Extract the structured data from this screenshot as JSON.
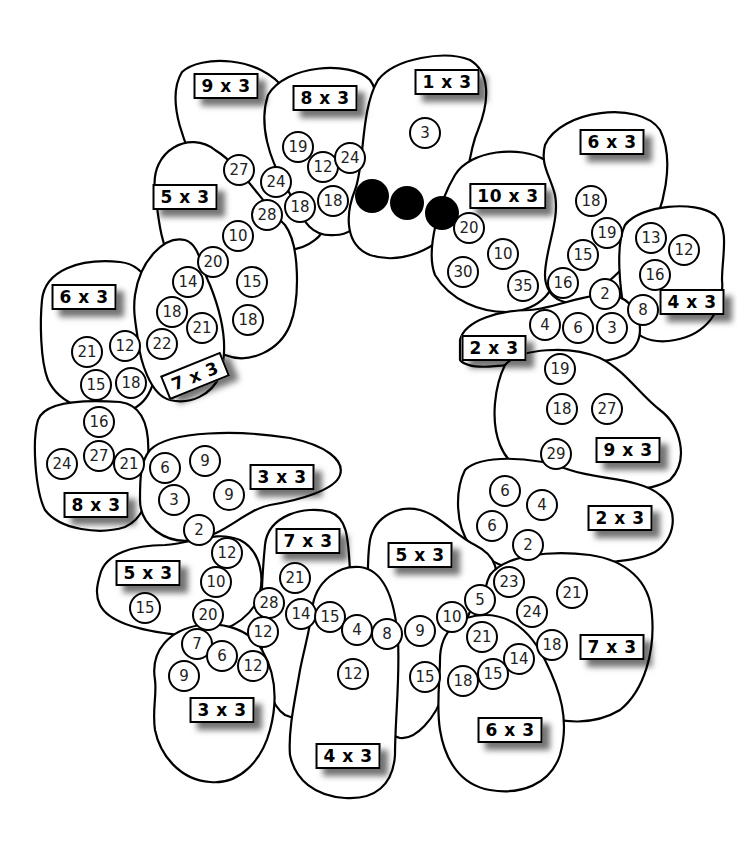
{
  "worksheet": {
    "theme": "3 times table caterpillar / flower ring puzzle",
    "colors": {
      "outline": "#000000",
      "fill": "#ffffff",
      "dot": "#000000"
    }
  },
  "regions": [
    {
      "id": "r1",
      "label": "1 x 3",
      "lx": 447,
      "ly": 82,
      "numbers": [
        {
          "v": "3",
          "x": 425,
          "y": 133
        }
      ]
    },
    {
      "id": "r2",
      "label": "8 x 3",
      "lx": 325,
      "ly": 98,
      "numbers": [
        {
          "v": "19",
          "x": 298,
          "y": 147
        },
        {
          "v": "12",
          "x": 323,
          "y": 167
        },
        {
          "v": "24",
          "x": 350,
          "y": 158
        },
        {
          "v": "18",
          "x": 333,
          "y": 201
        },
        {
          "v": "18",
          "x": 300,
          "y": 207
        }
      ]
    },
    {
      "id": "r3",
      "label": "9 x 3",
      "lx": 226,
      "ly": 86,
      "numbers": [
        {
          "v": "27",
          "x": 239,
          "y": 170
        },
        {
          "v": "24",
          "x": 276,
          "y": 182
        },
        {
          "v": "28",
          "x": 267,
          "y": 215
        }
      ]
    },
    {
      "id": "r4",
      "label": "5 x 3",
      "lx": 185,
      "ly": 197,
      "numbers": [
        {
          "v": "10",
          "x": 238,
          "y": 236
        },
        {
          "v": "20",
          "x": 213,
          "y": 262
        },
        {
          "v": "15",
          "x": 252,
          "y": 282
        },
        {
          "v": "18",
          "x": 248,
          "y": 320
        }
      ]
    },
    {
      "id": "r5",
      "label": "10 x 3",
      "lx": 508,
      "ly": 196,
      "numbers": [
        {
          "v": "20",
          "x": 469,
          "y": 228
        },
        {
          "v": "10",
          "x": 503,
          "y": 254
        },
        {
          "v": "30",
          "x": 463,
          "y": 272
        },
        {
          "v": "35",
          "x": 523,
          "y": 286
        }
      ]
    },
    {
      "id": "r6",
      "label": "6 x 3",
      "lx": 612,
      "ly": 142,
      "numbers": [
        {
          "v": "18",
          "x": 591,
          "y": 201
        },
        {
          "v": "19",
          "x": 607,
          "y": 233
        },
        {
          "v": "15",
          "x": 583,
          "y": 255
        },
        {
          "v": "16",
          "x": 563,
          "y": 283
        }
      ]
    },
    {
      "id": "r7",
      "label": "4 x 3",
      "lx": 692,
      "ly": 302,
      "numbers": [
        {
          "v": "13",
          "x": 651,
          "y": 238
        },
        {
          "v": "12",
          "x": 684,
          "y": 250
        },
        {
          "v": "16",
          "x": 655,
          "y": 275
        },
        {
          "v": "8",
          "x": 643,
          "y": 310
        }
      ]
    },
    {
      "id": "r8",
      "label": "2 x 3",
      "lx": 494,
      "ly": 348,
      "numbers": [
        {
          "v": "2",
          "x": 605,
          "y": 294
        },
        {
          "v": "4",
          "x": 545,
          "y": 325
        },
        {
          "v": "6",
          "x": 578,
          "y": 328
        },
        {
          "v": "3",
          "x": 612,
          "y": 328
        }
      ]
    },
    {
      "id": "r9",
      "label": "6 x 3",
      "lx": 84,
      "ly": 297,
      "numbers": [
        {
          "v": "21",
          "x": 87,
          "y": 352
        },
        {
          "v": "12",
          "x": 125,
          "y": 346
        },
        {
          "v": "15",
          "x": 96,
          "y": 385
        },
        {
          "v": "18",
          "x": 131,
          "y": 383
        }
      ]
    },
    {
      "id": "r10",
      "label": "7 x 3",
      "lx": 195,
      "ly": 376,
      "rotate": -22,
      "numbers": [
        {
          "v": "14",
          "x": 188,
          "y": 282
        },
        {
          "v": "18",
          "x": 172,
          "y": 312
        },
        {
          "v": "21",
          "x": 202,
          "y": 328
        },
        {
          "v": "22",
          "x": 162,
          "y": 344
        }
      ]
    },
    {
      "id": "r11",
      "label": "9 x 3",
      "lx": 628,
      "ly": 450,
      "numbers": [
        {
          "v": "19",
          "x": 560,
          "y": 369
        },
        {
          "v": "18",
          "x": 562,
          "y": 409
        },
        {
          "v": "27",
          "x": 607,
          "y": 409
        },
        {
          "v": "29",
          "x": 556,
          "y": 454
        }
      ]
    },
    {
      "id": "r12",
      "label": "8 x 3",
      "lx": 96,
      "ly": 505,
      "numbers": [
        {
          "v": "16",
          "x": 99,
          "y": 422
        },
        {
          "v": "27",
          "x": 99,
          "y": 456
        },
        {
          "v": "21",
          "x": 129,
          "y": 464
        },
        {
          "v": "24",
          "x": 62,
          "y": 464
        }
      ]
    },
    {
      "id": "r13",
      "label": "3 x 3",
      "lx": 282,
      "ly": 477,
      "numbers": [
        {
          "v": "6",
          "x": 165,
          "y": 468
        },
        {
          "v": "9",
          "x": 205,
          "y": 461
        },
        {
          "v": "3",
          "x": 174,
          "y": 500
        },
        {
          "v": "9",
          "x": 229,
          "y": 495
        },
        {
          "v": "2",
          "x": 199,
          "y": 530
        }
      ]
    },
    {
      "id": "r14",
      "label": "2 x 3",
      "lx": 620,
      "ly": 518,
      "numbers": [
        {
          "v": "6",
          "x": 505,
          "y": 491
        },
        {
          "v": "4",
          "x": 542,
          "y": 505
        },
        {
          "v": "6",
          "x": 492,
          "y": 526
        },
        {
          "v": "2",
          "x": 528,
          "y": 545
        }
      ]
    },
    {
      "id": "r15",
      "label": "5 x 3",
      "lx": 148,
      "ly": 573,
      "numbers": [
        {
          "v": "12",
          "x": 227,
          "y": 553
        },
        {
          "v": "10",
          "x": 216,
          "y": 582
        },
        {
          "v": "20",
          "x": 208,
          "y": 615
        },
        {
          "v": "15",
          "x": 145,
          "y": 608
        }
      ]
    },
    {
      "id": "r16",
      "label": "7 x 3",
      "lx": 308,
      "ly": 541,
      "numbers": [
        {
          "v": "21",
          "x": 295,
          "y": 578
        },
        {
          "v": "28",
          "x": 269,
          "y": 603
        },
        {
          "v": "14",
          "x": 301,
          "y": 614
        },
        {
          "v": "12",
          "x": 263,
          "y": 632
        }
      ]
    },
    {
      "id": "r17",
      "label": "5 x 3",
      "lx": 420,
      "ly": 555,
      "numbers": [
        {
          "v": "5",
          "x": 480,
          "y": 600
        },
        {
          "v": "10",
          "x": 452,
          "y": 617
        },
        {
          "v": "15",
          "x": 425,
          "y": 677
        }
      ]
    },
    {
      "id": "r18",
      "label": "7 x 3",
      "lx": 612,
      "ly": 647,
      "numbers": [
        {
          "v": "23",
          "x": 509,
          "y": 582
        },
        {
          "v": "21",
          "x": 572,
          "y": 593
        },
        {
          "v": "24",
          "x": 532,
          "y": 612
        },
        {
          "v": "18",
          "x": 552,
          "y": 645
        }
      ]
    },
    {
      "id": "r19",
      "label": "3 x 3",
      "lx": 222,
      "ly": 710,
      "numbers": [
        {
          "v": "7",
          "x": 197,
          "y": 644
        },
        {
          "v": "6",
          "x": 222,
          "y": 656
        },
        {
          "v": "12",
          "x": 253,
          "y": 666
        },
        {
          "v": "9",
          "x": 184,
          "y": 676
        }
      ]
    },
    {
      "id": "r20",
      "label": "4 x 3",
      "lx": 348,
      "ly": 756,
      "numbers": [
        {
          "v": "15",
          "x": 330,
          "y": 617
        },
        {
          "v": "4",
          "x": 357,
          "y": 630
        },
        {
          "v": "8",
          "x": 387,
          "y": 634
        },
        {
          "v": "9",
          "x": 420,
          "y": 631
        },
        {
          "v": "12",
          "x": 353,
          "y": 674
        }
      ]
    },
    {
      "id": "r21",
      "label": "6 x 3",
      "lx": 510,
      "ly": 730,
      "numbers": [
        {
          "v": "21",
          "x": 482,
          "y": 637
        },
        {
          "v": "14",
          "x": 519,
          "y": 659
        },
        {
          "v": "15",
          "x": 493,
          "y": 674
        },
        {
          "v": "18",
          "x": 463,
          "y": 681
        }
      ]
    }
  ],
  "dots": [
    {
      "x": 372,
      "y": 196
    },
    {
      "x": 407,
      "y": 203
    },
    {
      "x": 442,
      "y": 213
    }
  ]
}
